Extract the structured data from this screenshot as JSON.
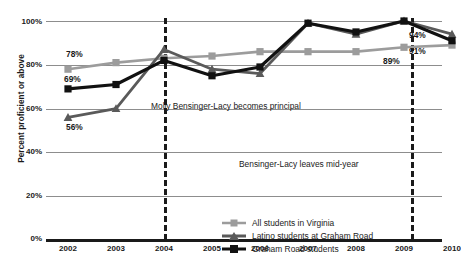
{
  "chart_data": {
    "type": "line",
    "title": "",
    "xlabel": "",
    "ylabel": "Percent proficient or above",
    "x": [
      "2002",
      "2003",
      "2004",
      "2005",
      "2006",
      "2007",
      "2008",
      "2009",
      "2010"
    ],
    "categories": [
      "2002",
      "2003",
      "2004",
      "2005",
      "2006",
      "2007",
      "2008",
      "2009",
      "2010"
    ],
    "ylim": [
      0,
      100
    ],
    "yticks": [
      "0%",
      "20%",
      "40%",
      "60%",
      "80%",
      "100%"
    ],
    "ytick_values": [
      0,
      20,
      40,
      60,
      80,
      100
    ],
    "grid": "horizontal",
    "legend_position": "inside-bottom-center",
    "series": [
      {
        "name": "All students in Virginia",
        "color": "#9c9c9c",
        "marker": "square",
        "values": [
          78,
          81,
          83,
          84,
          86,
          86,
          86,
          88,
          89
        ]
      },
      {
        "name": "Latino students at Graham Road",
        "color": "#5a5a5a",
        "marker": "triangle",
        "values": [
          56,
          60,
          87,
          78,
          76,
          99,
          94,
          100,
          94
        ]
      },
      {
        "name": "Graham Road students",
        "color": "#111111",
        "marker": "square",
        "values": [
          69,
          71,
          82,
          75,
          79,
          99,
          95,
          100,
          91
        ]
      }
    ],
    "point_labels": [
      {
        "text": "78%",
        "series": "All students in Virginia",
        "x": "2002",
        "value": 78
      },
      {
        "text": "69%",
        "series": "Graham Road students",
        "x": "2002",
        "value": 69
      },
      {
        "text": "56%",
        "series": "Latino students at Graham Road",
        "x": "2002",
        "value": 56
      },
      {
        "text": "94%",
        "series": "Latino students at Graham Road",
        "x": "2010",
        "value": 94
      },
      {
        "text": "91%",
        "series": "Graham Road students",
        "x": "2010",
        "value": 91
      },
      {
        "text": "89%",
        "series": "All students in Virginia",
        "x": "2010",
        "value": 89
      }
    ],
    "annotations": [
      {
        "text": "Molly Bensinger-Lacy becomes principal",
        "at_x": "mid-2003"
      },
      {
        "text": "Bensinger-Lacy leaves mid-year",
        "at_x": "mid-2009"
      }
    ],
    "event_lines": [
      {
        "label": "Molly Bensinger-Lacy becomes principal",
        "position": "between 2003 and 2004",
        "style": "dashed"
      },
      {
        "label": "Bensinger-Lacy leaves mid-year",
        "position": "between 2009 and 2010",
        "style": "dashed"
      }
    ]
  },
  "labels": {
    "y_title": "Percent proficient or above",
    "y_100": "100%",
    "y_80": "80%",
    "y_60": "60%",
    "y_40": "40%",
    "y_20": "20%",
    "y_0": "0%",
    "x_2002": "2002",
    "x_2003": "2003",
    "x_2004": "2004",
    "x_2005": "2005",
    "x_2006": "2006",
    "x_2007": "2007",
    "x_2008": "2008",
    "x_2009": "2009",
    "x_2010": "2010",
    "lab_78": "78%",
    "lab_69": "69%",
    "lab_56": "56%",
    "lab_94": "94%",
    "lab_91": "91%",
    "lab_89": "89%",
    "annot_principal": "Molly Bensinger-Lacy becomes principal",
    "annot_leaves": "Bensinger-Lacy leaves mid-year",
    "legend_virginia": "All students in Virginia",
    "legend_latino": "Latino students at Graham Road",
    "legend_graham": "Graham Road students"
  },
  "colors": {
    "virginia": "#9c9c9c",
    "latino": "#5a5a5a",
    "graham": "#111111",
    "grid": "#8d8d8d",
    "axis": "#1a1a1a"
  }
}
